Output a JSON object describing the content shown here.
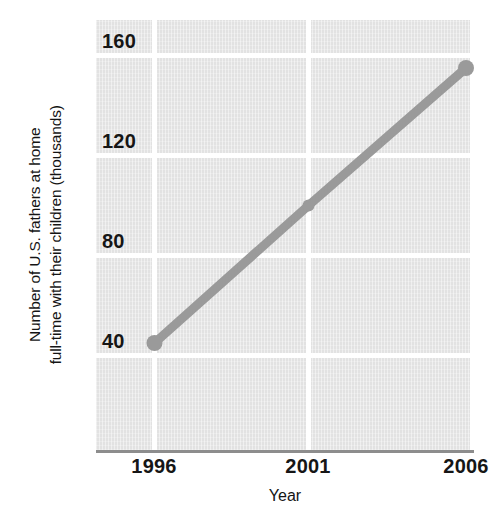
{
  "chart_data": {
    "type": "line",
    "title": "",
    "xlabel": "Year",
    "ylabel": "Number of U.S. fathers at home full-time with their children (thousands)",
    "ylabel_lines": [
      "Number of U.S. fathers at home",
      "full-time with their children (thousands)"
    ],
    "x": [
      1996,
      2001,
      2006
    ],
    "xtick_labels": [
      "1996",
      "2001",
      "2006"
    ],
    "values": [
      45,
      100,
      155
    ],
    "series": [
      {
        "name": "Fathers at home full-time",
        "values": [
          45,
          100,
          155
        ]
      }
    ],
    "ytick_labels": [
      "160",
      "120",
      "80",
      "40"
    ],
    "yticks": [
      160,
      120,
      80,
      40
    ],
    "ylim": [
      0,
      172
    ],
    "xlim": [
      1994,
      2006
    ],
    "grid": true,
    "grid_color": "#ffffff",
    "legend": "none",
    "plot_background": "#e2e2e2",
    "line_color": "#9a9a9a",
    "marker_color": "#9a9a9a",
    "axis_color": "#8d8d8d",
    "text_color": "#161616"
  }
}
